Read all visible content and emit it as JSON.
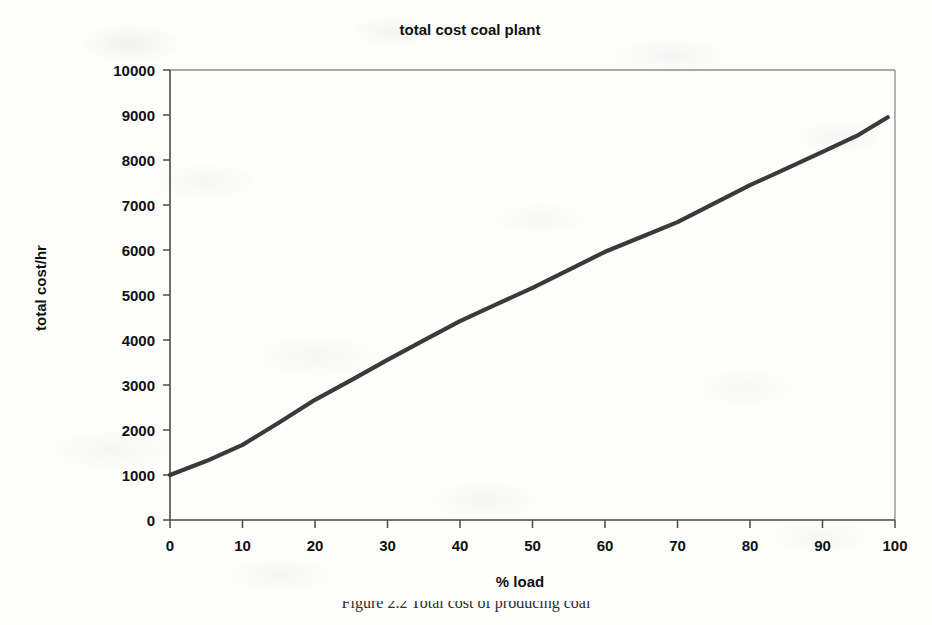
{
  "page": {
    "width": 932,
    "height": 625,
    "background_color": "#fdfdfc"
  },
  "figure": {
    "caption": "Figure 2.2  Total cost of producing coal"
  },
  "chart_data": {
    "type": "line",
    "title": "total cost coal plant",
    "xlabel": "% load",
    "ylabel": "total cost/hr",
    "xlim": [
      0,
      100
    ],
    "ylim": [
      0,
      10000
    ],
    "xticks": [
      0,
      10,
      20,
      30,
      40,
      50,
      60,
      70,
      80,
      90,
      100
    ],
    "yticks": [
      0,
      1000,
      2000,
      3000,
      4000,
      5000,
      6000,
      7000,
      8000,
      9000,
      10000
    ],
    "xtick_labels": [
      "0",
      "10",
      "20",
      "30",
      "40",
      "50",
      "60",
      "70",
      "80",
      "90",
      "100"
    ],
    "ytick_labels": [
      "0",
      "1000",
      "2000",
      "3000",
      "4000",
      "5000",
      "6000",
      "7000",
      "8000",
      "9000",
      "10000"
    ],
    "grid": false,
    "legend": null,
    "series": [
      {
        "name": "total cost/hr",
        "color": "#3a3a3a",
        "line_width": 4.2,
        "x": [
          0,
          5,
          10,
          15,
          20,
          25,
          30,
          35,
          40,
          45,
          50,
          55,
          60,
          65,
          70,
          75,
          80,
          85,
          90,
          95,
          99
        ],
        "y": [
          1000,
          1310,
          1670,
          2160,
          2670,
          3110,
          3560,
          3990,
          4420,
          4790,
          5160,
          5560,
          5960,
          6290,
          6620,
          7030,
          7440,
          7810,
          8180,
          8560,
          8950
        ]
      }
    ]
  },
  "axes_geometry": {
    "plot_left": 170,
    "plot_right": 895,
    "plot_top": 70,
    "plot_bottom": 520
  }
}
